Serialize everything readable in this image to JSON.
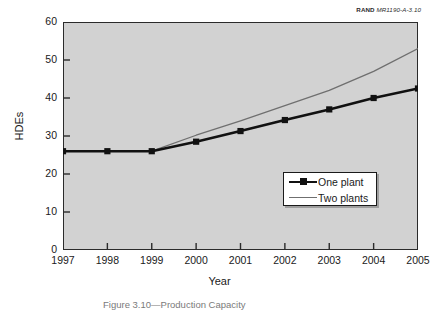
{
  "source_credit": {
    "org": "RAND",
    "code": "MR1190-A-3.10"
  },
  "caption": {
    "text": "Figure 3.10—Production Capacity"
  },
  "colors": {
    "plot_background": "#d2d2d2",
    "page_background": "#ffffff",
    "axis": "#2b2b2b",
    "one_plant": "#111111",
    "two_plants": "#6f6f6f",
    "legend_background": "#ffffff"
  },
  "legend": {
    "position": "inside-lower-right",
    "entries": [
      {
        "label": "One plant",
        "marker": "square",
        "style": "thick-black-line-with-markers"
      },
      {
        "label": "Two plants",
        "marker": "none",
        "style": "thin-gray-line"
      }
    ]
  },
  "chart_data": {
    "type": "line",
    "title": "",
    "subtitle": "",
    "xlabel": "Year",
    "ylabel": "HDEs",
    "categories": [
      "1997",
      "1998",
      "1999",
      "2000",
      "2001",
      "2002",
      "2003",
      "2004",
      "2005"
    ],
    "x": [
      1997,
      1998,
      1999,
      2000,
      2001,
      2002,
      2003,
      2004,
      2005
    ],
    "xlim": [
      1997,
      2005
    ],
    "ylim": [
      0,
      60
    ],
    "yticks": [
      0,
      10,
      20,
      30,
      40,
      50,
      60
    ],
    "xticks": [
      1997,
      1998,
      1999,
      2000,
      2001,
      2002,
      2003,
      2004,
      2005
    ],
    "grid": false,
    "legend_position": "lower right inside axes",
    "series": [
      {
        "name": "One plant",
        "color": "#111111",
        "marker": "square",
        "values": [
          26.0,
          26.0,
          26.0,
          28.5,
          31.3,
          34.2,
          37.0,
          40.0,
          42.5
        ]
      },
      {
        "name": "Two plants",
        "color": "#6f6f6f",
        "marker": "none",
        "values": [
          26.0,
          26.0,
          26.0,
          30.2,
          34.0,
          38.0,
          42.0,
          47.0,
          53.0
        ]
      }
    ],
    "annotations": [
      {
        "text": "RAND MR1190-A-3.10",
        "position": "top-right-outside"
      }
    ]
  }
}
